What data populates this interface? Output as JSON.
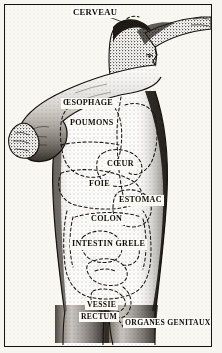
{
  "illustration": {
    "title": "Anatomical diagram of internal organs (French)",
    "style": "engraving-halftone",
    "language": "French",
    "figure": "standing human figure, right arm raised across chest, left arm outstretched, head in profile facing right",
    "colors": {
      "ink": "#15120f",
      "paper": "#faf8f2",
      "page": "#f7f5ef",
      "label_box": "#fbfaf5",
      "dash": "#1a1713"
    }
  },
  "frame": {
    "present": true,
    "border_color": "#15120f"
  },
  "labels": [
    {
      "id": "cerveau",
      "text": "CERVEAU",
      "x": 70,
      "y": 6,
      "size": "s9"
    },
    {
      "id": "oesophage",
      "text": "ŒSOPHAGE",
      "x": 60,
      "y": 97,
      "size": "s85"
    },
    {
      "id": "poumons",
      "text": "POUMONS",
      "x": 67,
      "y": 117,
      "size": "s85"
    },
    {
      "id": "coeur",
      "text": "CŒUR",
      "x": 104,
      "y": 158,
      "size": "s85"
    },
    {
      "id": "foie",
      "text": "FOIE",
      "x": 86,
      "y": 178,
      "size": "s85"
    },
    {
      "id": "estomac",
      "text": "ESTOMAC",
      "x": 116,
      "y": 194,
      "size": "s85"
    },
    {
      "id": "colon",
      "text": "COLON",
      "x": 88,
      "y": 213,
      "size": "s85"
    },
    {
      "id": "intestin-grele",
      "text": "INTESTIN GRELE",
      "x": 69,
      "y": 238,
      "size": "s85"
    },
    {
      "id": "vessie",
      "text": "VESSIE",
      "x": 84,
      "y": 299,
      "size": "s8"
    },
    {
      "id": "rectum",
      "text": "RECTUM",
      "x": 78,
      "y": 311,
      "size": "s8"
    },
    {
      "id": "organes-genitaux",
      "text": "ORGANES GENITAUX",
      "x": 122,
      "y": 317,
      "size": "s8"
    }
  ]
}
